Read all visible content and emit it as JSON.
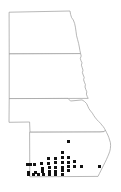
{
  "figure": {
    "background_color": "#ffffff",
    "outline_color": "#9a9a9a",
    "dot_color": "#121212",
    "dot_symbol": "filled-square",
    "dot_size_px": 3,
    "width_px": 121,
    "height_px": 192
  },
  "states": [
    {
      "id": "north-dakota",
      "name": "North Dakota",
      "order": 1,
      "dot_count": 0,
      "outline": "M 9.5,12.2 L 70.0,11.0 L 70.6,14.4 L 71.6,17.6 L 73.3,20.0 L 74.6,23.4 L 75.4,27.2 L 76.0,31.4 L 76.6,35.8 L 77.6,39.6 L 78.6,43.4 L 79.3,47.0 L 79.9,50.4 L 80.6,53.6 L 9.6,53.9 Z"
    },
    {
      "id": "south-dakota",
      "name": "South Dakota",
      "order": 2,
      "dot_count": 0,
      "outline": "M 9.6,53.9 L 80.6,53.6 L 81.2,56.0 L 80.3,58.4 L 81.0,60.8 L 82.0,62.8 L 81.4,65.2 L 82.2,67.6 L 83.0,70.2 L 82.4,72.6 L 83.2,75.0 L 84.2,77.4 L 83.6,79.8 L 84.4,82.2 L 85.4,84.6 L 85.0,87.0 L 85.8,89.4 L 86.8,91.8 L 86.4,94.2 L 87.2,96.4 L 88.2,98.4 L 9.6,98.6 Z"
    },
    {
      "id": "nebraska",
      "name": "Nebraska",
      "order": 3,
      "has_panhandle": true,
      "dot_count": 0,
      "outline": "M 9.6,98.6 L 68.0,98.4 L 70.5,101.0 L 75.0,100.6 L 79.0,100.2 L 82.0,99.9 L 84.4,101.4 L 86.6,103.6 L 87.8,106.2 L 89.0,108.8 L 90.6,111.0 L 92.4,113.2 L 93.8,115.6 L 95.4,117.8 L 97.0,119.8 L 98.8,121.6 L 100.4,123.2 L 101.8,125.0 L 103.2,126.6 L 104.4,128.4 L 105.4,130.2 L 104.2,131.6 L 102.0,131.8 L 100.0,132.0 L 30.0,132.2 L 29.6,122.0 L 9.4,122.3 Z"
    },
    {
      "id": "kansas",
      "name": "Kansas",
      "order": 4,
      "dot_count": 37,
      "outline": "M 30.0,132.2 L 100.0,132.0 L 102.0,131.8 L 104.2,131.6 L 105.4,130.2 L 106.6,132.6 L 107.8,135.0 L 108.8,137.4 L 109.6,140.0 L 110.4,142.6 L 110.6,145.4 L 110.4,148.4 L 109.8,151.2 L 108.8,154.0 L 107.6,156.8 L 106.4,159.6 L 105.0,162.4 L 103.6,165.2 L 102.2,168.0 L 100.8,170.8 L 99.4,173.6 L 98.0,176.4 L 30.2,176.8 Z"
    }
  ],
  "river_border": {
    "name": "Missouri River eastern boundary",
    "description": "Irregular wavy eastern border following the Missouri River between the Dakotas and adjacent states"
  },
  "occurrence_points": [
    {
      "id": "pt-01",
      "x": 68.5,
      "y": 141.5,
      "region": "north-central Kansas"
    },
    {
      "id": "pt-02",
      "x": 62.0,
      "y": 152.5,
      "region": "central Kansas"
    },
    {
      "id": "pt-03",
      "x": 68.5,
      "y": 157.0,
      "region": "central Kansas"
    },
    {
      "id": "pt-04",
      "x": 62.0,
      "y": 157.5,
      "region": "central Kansas"
    },
    {
      "id": "pt-05",
      "x": 55.0,
      "y": 158.0,
      "region": "central Kansas"
    },
    {
      "id": "pt-06",
      "x": 48.0,
      "y": 158.5,
      "region": "central Kansas"
    },
    {
      "id": "pt-07",
      "x": 74.5,
      "y": 161.5,
      "region": "east-central Kansas"
    },
    {
      "id": "pt-08",
      "x": 68.5,
      "y": 162.0,
      "region": "central Kansas"
    },
    {
      "id": "pt-09",
      "x": 62.0,
      "y": 162.5,
      "region": "central Kansas"
    },
    {
      "id": "pt-10",
      "x": 55.5,
      "y": 162.5,
      "region": "central Kansas"
    },
    {
      "id": "pt-11",
      "x": 48.5,
      "y": 163.0,
      "region": "central Kansas"
    },
    {
      "id": "pt-12",
      "x": 41.5,
      "y": 163.5,
      "region": "west-central Kansas"
    },
    {
      "id": "pt-13",
      "x": 34.5,
      "y": 164.0,
      "region": "western Kansas"
    },
    {
      "id": "pt-14",
      "x": 30.5,
      "y": 164.0,
      "region": "western Kansas"
    },
    {
      "id": "pt-15",
      "x": 27.0,
      "y": 164.0,
      "region": "western Kansas"
    },
    {
      "id": "pt-16",
      "x": 81.0,
      "y": 166.0,
      "region": "east-central Kansas"
    },
    {
      "id": "pt-17",
      "x": 74.5,
      "y": 166.5,
      "region": "east-central Kansas"
    },
    {
      "id": "pt-18",
      "x": 68.5,
      "y": 166.5,
      "region": "central Kansas"
    },
    {
      "id": "pt-19",
      "x": 62.0,
      "y": 167.0,
      "region": "central Kansas"
    },
    {
      "id": "pt-20",
      "x": 55.5,
      "y": 167.0,
      "region": "central Kansas"
    },
    {
      "id": "pt-21",
      "x": 49.0,
      "y": 167.5,
      "region": "central Kansas"
    },
    {
      "id": "pt-22",
      "x": 42.0,
      "y": 168.0,
      "region": "west-central Kansas"
    },
    {
      "id": "pt-23",
      "x": 68.5,
      "y": 170.5,
      "region": "south-central Kansas"
    },
    {
      "id": "pt-24",
      "x": 62.0,
      "y": 170.5,
      "region": "south-central Kansas"
    },
    {
      "id": "pt-25",
      "x": 55.5,
      "y": 171.0,
      "region": "south-central Kansas"
    },
    {
      "id": "pt-26",
      "x": 49.0,
      "y": 171.0,
      "region": "south-central Kansas"
    },
    {
      "id": "pt-27",
      "x": 42.0,
      "y": 171.5,
      "region": "southwest Kansas"
    },
    {
      "id": "pt-28",
      "x": 35.0,
      "y": 172.0,
      "region": "southwest Kansas"
    },
    {
      "id": "pt-29",
      "x": 28.0,
      "y": 172.0,
      "region": "southwest Kansas"
    },
    {
      "id": "pt-30",
      "x": 62.0,
      "y": 174.5,
      "region": "southern Kansas border"
    },
    {
      "id": "pt-31",
      "x": 55.5,
      "y": 174.5,
      "region": "southern Kansas border"
    },
    {
      "id": "pt-32",
      "x": 49.0,
      "y": 174.5,
      "region": "southern Kansas border"
    },
    {
      "id": "pt-33",
      "x": 43.5,
      "y": 174.5,
      "region": "southern Kansas border"
    },
    {
      "id": "pt-34",
      "x": 38.0,
      "y": 174.5,
      "region": "southern Kansas border"
    },
    {
      "id": "pt-35",
      "x": 33.0,
      "y": 174.5,
      "region": "southern Kansas border"
    },
    {
      "id": "pt-36",
      "x": 28.0,
      "y": 174.5,
      "region": "southern Kansas border"
    },
    {
      "id": "pt-37",
      "x": 99.0,
      "y": 166.5,
      "region": "southeast Kansas"
    }
  ]
}
